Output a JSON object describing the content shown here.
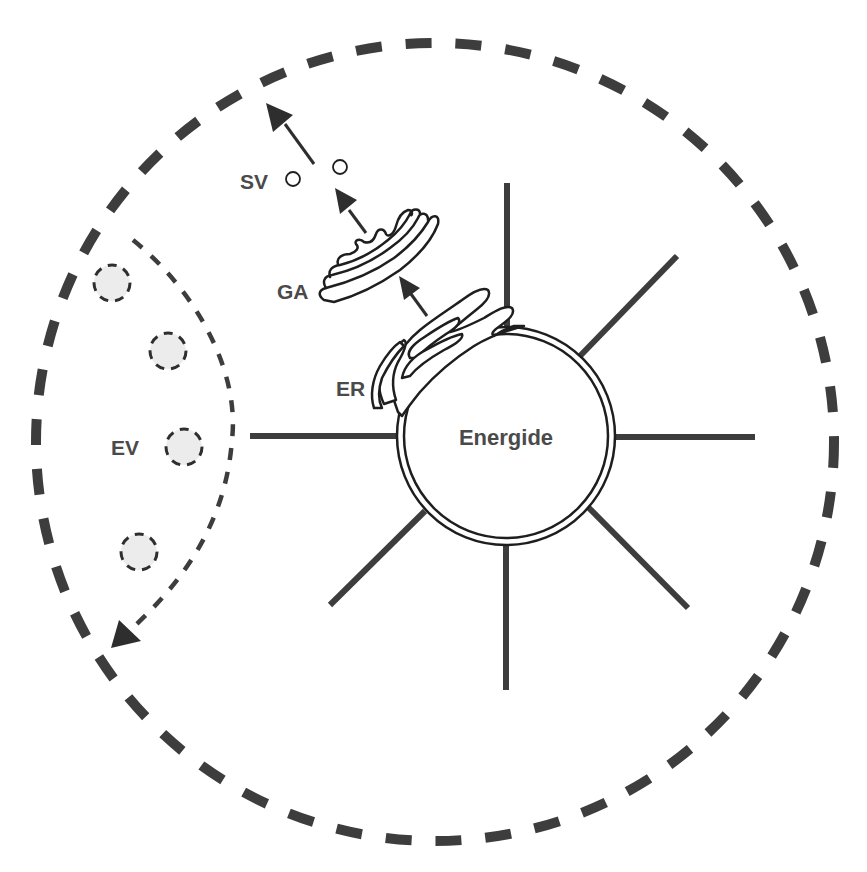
{
  "colors": {
    "stroke": "#3d3d3d",
    "outline": "#1e1e1e",
    "vesicle_fill": "#e8e8e8",
    "text": "#4a4a4a",
    "background": "#ffffff"
  },
  "labels": {
    "nucleus": "Energide",
    "er": "ER",
    "golgi": "GA",
    "secretory_vesicles": "SV",
    "endocytic_vesicles": "EV"
  },
  "elements": {
    "outer_boundary": "dashed energide domain boundary",
    "radial_microtubules": 8,
    "secretory_vesicle_count": 2,
    "endocytic_vesicle_count": 4,
    "arrows": [
      "ER to GA",
      "GA to SV",
      "SV to membrane",
      "EV pathway (endocytic)"
    ]
  }
}
